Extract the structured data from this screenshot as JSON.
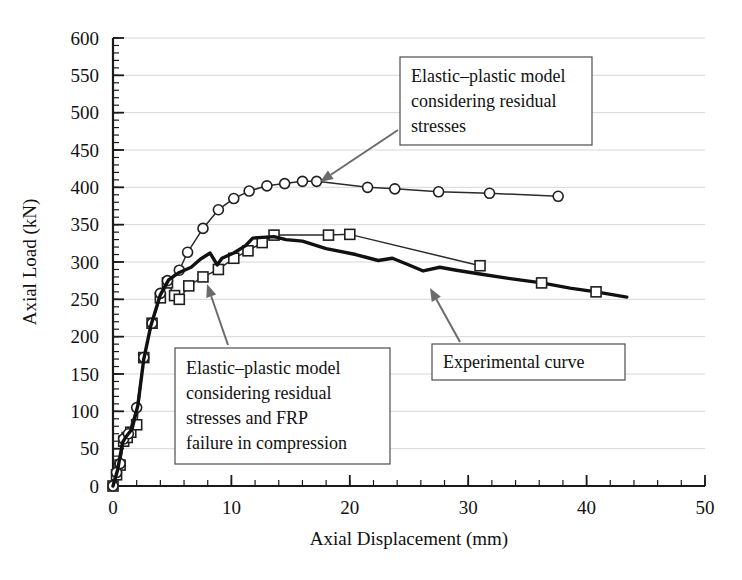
{
  "chart_data": {
    "type": "line",
    "title": "",
    "xlabel": "Axial Displacement (mm)",
    "ylabel": "Axial Load (kN)",
    "xlim": [
      0,
      50
    ],
    "ylim": [
      0,
      600
    ],
    "xticks": [
      0,
      10,
      20,
      30,
      40,
      50
    ],
    "yticks": [
      0,
      50,
      100,
      150,
      200,
      250,
      300,
      350,
      400,
      450,
      500,
      550,
      600
    ],
    "xtick_labels": [
      "0",
      "10",
      "20",
      "30",
      "40",
      "50"
    ],
    "ytick_labels": [
      "0",
      "50",
      "100",
      "150",
      "200",
      "250",
      "300",
      "350",
      "400",
      "450",
      "500",
      "550",
      "600"
    ],
    "x_minor_step": 2,
    "y_minor_step": 10,
    "grid": "horizontal",
    "legend": "none",
    "series": [
      {
        "name": "Elastic-plastic model considering residual stresses",
        "marker": "circle",
        "line_weight": "thin",
        "points": [
          [
            0.0,
            0
          ],
          [
            0.3,
            18
          ],
          [
            0.6,
            30
          ],
          [
            0.9,
            63
          ],
          [
            1.3,
            70
          ],
          [
            2.0,
            105
          ],
          [
            2.6,
            172
          ],
          [
            3.3,
            218
          ],
          [
            4.0,
            258
          ],
          [
            4.6,
            275
          ],
          [
            5.6,
            289
          ],
          [
            6.3,
            313
          ],
          [
            7.6,
            345
          ],
          [
            8.9,
            370
          ],
          [
            10.2,
            385
          ],
          [
            11.5,
            395
          ],
          [
            13.0,
            402
          ],
          [
            14.5,
            405
          ],
          [
            16.0,
            408
          ],
          [
            17.2,
            408
          ],
          [
            21.5,
            400
          ],
          [
            23.8,
            398
          ],
          [
            27.5,
            394
          ],
          [
            31.8,
            392
          ],
          [
            37.6,
            388
          ]
        ]
      },
      {
        "name": "Elastic-plastic model considering residual stresses and FRP failure in compression",
        "marker": "square",
        "line_weight": "thin",
        "points": [
          [
            0.0,
            0
          ],
          [
            0.3,
            15
          ],
          [
            0.6,
            28
          ],
          [
            0.9,
            60
          ],
          [
            1.2,
            65
          ],
          [
            1.5,
            72
          ],
          [
            2.0,
            82
          ],
          [
            2.6,
            172
          ],
          [
            3.3,
            218
          ],
          [
            4.0,
            252
          ],
          [
            4.6,
            272
          ],
          [
            5.2,
            255
          ],
          [
            5.6,
            250
          ],
          [
            6.4,
            268
          ],
          [
            7.6,
            280
          ],
          [
            8.9,
            290
          ],
          [
            10.2,
            305
          ],
          [
            11.4,
            315
          ],
          [
            12.6,
            326
          ],
          [
            13.6,
            336
          ],
          [
            18.2,
            336
          ],
          [
            20.0,
            337
          ],
          [
            31.0,
            295
          ]
        ]
      },
      {
        "name": "Experimental curve",
        "marker": "none",
        "line_weight": "thick",
        "points": [
          [
            0.0,
            0
          ],
          [
            0.4,
            22
          ],
          [
            0.8,
            58
          ],
          [
            1.1,
            66
          ],
          [
            1.6,
            76
          ],
          [
            2.1,
            108
          ],
          [
            2.6,
            170
          ],
          [
            3.2,
            215
          ],
          [
            4.0,
            256
          ],
          [
            4.7,
            276
          ],
          [
            5.6,
            286
          ],
          [
            6.6,
            293
          ],
          [
            7.4,
            304
          ],
          [
            8.2,
            312
          ],
          [
            8.8,
            296
          ],
          [
            9.2,
            305
          ],
          [
            10.2,
            312
          ],
          [
            11.2,
            322
          ],
          [
            11.8,
            332
          ],
          [
            12.6,
            333
          ],
          [
            13.6,
            334
          ],
          [
            14.6,
            330
          ],
          [
            16.0,
            328
          ],
          [
            18.0,
            318
          ],
          [
            20.5,
            310
          ],
          [
            22.4,
            302
          ],
          [
            23.6,
            305
          ],
          [
            25.0,
            296
          ],
          [
            26.2,
            288
          ],
          [
            27.6,
            293
          ],
          [
            29.0,
            289
          ],
          [
            31.0,
            284
          ],
          [
            33.4,
            278
          ],
          [
            36.2,
            272
          ],
          [
            38.6,
            265
          ],
          [
            40.8,
            260
          ],
          [
            43.4,
            253
          ]
        ],
        "markers": [
          [
            36.2,
            272
          ],
          [
            40.8,
            260
          ]
        ]
      }
    ],
    "annotations": [
      {
        "id": "anno-elastic-plastic-residual",
        "lines": [
          "Elastic–plastic model",
          "considering residual",
          "stresses"
        ],
        "box": {
          "x": 400,
          "y": 57,
          "w": 192,
          "h": 88
        },
        "arrow_from": [
          398,
          130
        ],
        "arrow_to": [
          320,
          182
        ]
      },
      {
        "id": "anno-elastic-plastic-frp",
        "lines": [
          "Elastic–plastic model",
          "considering residual",
          "stresses and FRP",
          "failure in compression"
        ],
        "box": {
          "x": 175,
          "y": 348,
          "w": 215,
          "h": 116
        },
        "arrow_from": [
          228,
          345
        ],
        "arrow_to": [
          207,
          284
        ]
      },
      {
        "id": "anno-experimental-curve",
        "lines": [
          "Experimental curve"
        ],
        "box": {
          "x": 432,
          "y": 344,
          "w": 193,
          "h": 36
        },
        "arrow_from": [
          460,
          342
        ],
        "arrow_to": [
          430,
          288
        ]
      }
    ]
  },
  "accessibility": {
    "figure_role": "scientific-line-chart"
  },
  "colors": {
    "background": "#ffffff",
    "axis": "#1a1a1a",
    "grid": "#d2d2d2",
    "curve_thin": "#2b2b2b",
    "curve_thick": "#111111",
    "annotation_border": "#4d4d4d",
    "leader": "#6b6b6b"
  }
}
